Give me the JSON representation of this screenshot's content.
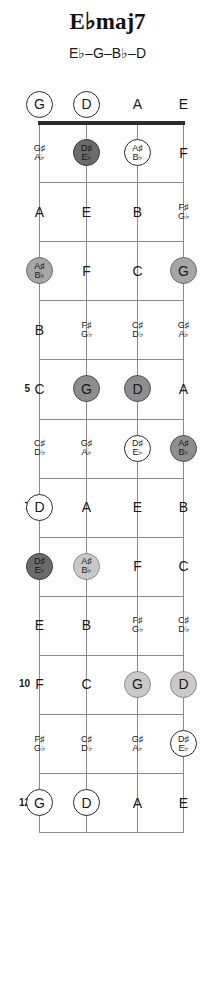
{
  "title": "E♭maj7",
  "subtitle": "E♭–G–B♭–D",
  "instrument": {
    "strings": 4,
    "open_strings": [
      "G",
      "D",
      "A",
      "E"
    ],
    "frets_shown": 12
  },
  "colors": {
    "root_fill": "#6b6b6b",
    "dark_fill": "#8e8e8e",
    "mid_fill": "#a6a6a6",
    "light_fill": "#c9c9c9",
    "open_fill": "#ffffff",
    "line": "#8a8a8a",
    "nut": "#2b2b2b",
    "text": "#1a1a1a"
  },
  "fret_numbers": [
    {
      "fret": 5,
      "label": "5"
    },
    {
      "fret": 7,
      "label": "7"
    },
    {
      "fret": 10,
      "label": "10"
    },
    {
      "fret": 12,
      "label": "12"
    }
  ],
  "notes": [
    {
      "fret": 0,
      "string": 1,
      "label": "G",
      "style": "open"
    },
    {
      "fret": 0,
      "string": 2,
      "label": "D",
      "style": "open"
    },
    {
      "fret": 0,
      "string": 3,
      "label": "A",
      "style": "plain"
    },
    {
      "fret": 0,
      "string": 4,
      "label": "E",
      "style": "plain"
    },
    {
      "fret": 1,
      "string": 1,
      "label": "G♯|A♭",
      "style": "plain"
    },
    {
      "fret": 1,
      "string": 2,
      "label": "D♯|E♭",
      "style": "root"
    },
    {
      "fret": 1,
      "string": 3,
      "label": "A♯|B♭",
      "style": "open"
    },
    {
      "fret": 1,
      "string": 4,
      "label": "F",
      "style": "plain"
    },
    {
      "fret": 2,
      "string": 1,
      "label": "A",
      "style": "plain"
    },
    {
      "fret": 2,
      "string": 2,
      "label": "E",
      "style": "plain"
    },
    {
      "fret": 2,
      "string": 3,
      "label": "B",
      "style": "plain"
    },
    {
      "fret": 2,
      "string": 4,
      "label": "F♯|G♭",
      "style": "plain"
    },
    {
      "fret": 3,
      "string": 1,
      "label": "A♯|B♭",
      "style": "mid"
    },
    {
      "fret": 3,
      "string": 2,
      "label": "F",
      "style": "plain"
    },
    {
      "fret": 3,
      "string": 3,
      "label": "C",
      "style": "plain"
    },
    {
      "fret": 3,
      "string": 4,
      "label": "G",
      "style": "mid"
    },
    {
      "fret": 4,
      "string": 1,
      "label": "B",
      "style": "plain"
    },
    {
      "fret": 4,
      "string": 2,
      "label": "F♯|G♭",
      "style": "plain"
    },
    {
      "fret": 4,
      "string": 3,
      "label": "C♯|D♭",
      "style": "plain"
    },
    {
      "fret": 4,
      "string": 4,
      "label": "G♯|A♭",
      "style": "plain"
    },
    {
      "fret": 5,
      "string": 1,
      "label": "C",
      "style": "plain"
    },
    {
      "fret": 5,
      "string": 2,
      "label": "G",
      "style": "dark"
    },
    {
      "fret": 5,
      "string": 3,
      "label": "D",
      "style": "dark"
    },
    {
      "fret": 5,
      "string": 4,
      "label": "A",
      "style": "plain"
    },
    {
      "fret": 6,
      "string": 1,
      "label": "C♯|D♭",
      "style": "plain"
    },
    {
      "fret": 6,
      "string": 2,
      "label": "G♯|A♭",
      "style": "plain"
    },
    {
      "fret": 6,
      "string": 3,
      "label": "D♯|E♭",
      "style": "open"
    },
    {
      "fret": 6,
      "string": 4,
      "label": "A♯|B♭",
      "style": "dark"
    },
    {
      "fret": 7,
      "string": 1,
      "label": "D",
      "style": "open"
    },
    {
      "fret": 7,
      "string": 2,
      "label": "A",
      "style": "plain"
    },
    {
      "fret": 7,
      "string": 3,
      "label": "E",
      "style": "plain"
    },
    {
      "fret": 7,
      "string": 4,
      "label": "B",
      "style": "plain"
    },
    {
      "fret": 8,
      "string": 1,
      "label": "D♯|E♭",
      "style": "root"
    },
    {
      "fret": 8,
      "string": 2,
      "label": "A♯|B♭",
      "style": "light"
    },
    {
      "fret": 8,
      "string": 3,
      "label": "F",
      "style": "plain"
    },
    {
      "fret": 8,
      "string": 4,
      "label": "C",
      "style": "plain"
    },
    {
      "fret": 9,
      "string": 1,
      "label": "E",
      "style": "plain"
    },
    {
      "fret": 9,
      "string": 2,
      "label": "B",
      "style": "plain"
    },
    {
      "fret": 9,
      "string": 3,
      "label": "F♯|G♭",
      "style": "plain"
    },
    {
      "fret": 9,
      "string": 4,
      "label": "C♯|D♭",
      "style": "plain"
    },
    {
      "fret": 10,
      "string": 1,
      "label": "F",
      "style": "plain"
    },
    {
      "fret": 10,
      "string": 2,
      "label": "C",
      "style": "plain"
    },
    {
      "fret": 10,
      "string": 3,
      "label": "G",
      "style": "light"
    },
    {
      "fret": 10,
      "string": 4,
      "label": "D",
      "style": "light"
    },
    {
      "fret": 11,
      "string": 1,
      "label": "F♯|G♭",
      "style": "plain"
    },
    {
      "fret": 11,
      "string": 2,
      "label": "C♯|D♭",
      "style": "plain"
    },
    {
      "fret": 11,
      "string": 3,
      "label": "G♯|A♭",
      "style": "plain"
    },
    {
      "fret": 11,
      "string": 4,
      "label": "D♯|E♭",
      "style": "open"
    },
    {
      "fret": 12,
      "string": 1,
      "label": "G",
      "style": "open"
    },
    {
      "fret": 12,
      "string": 2,
      "label": "D",
      "style": "open"
    },
    {
      "fret": 12,
      "string": 3,
      "label": "A",
      "style": "plain"
    },
    {
      "fret": 12,
      "string": 4,
      "label": "E",
      "style": "plain"
    }
  ]
}
